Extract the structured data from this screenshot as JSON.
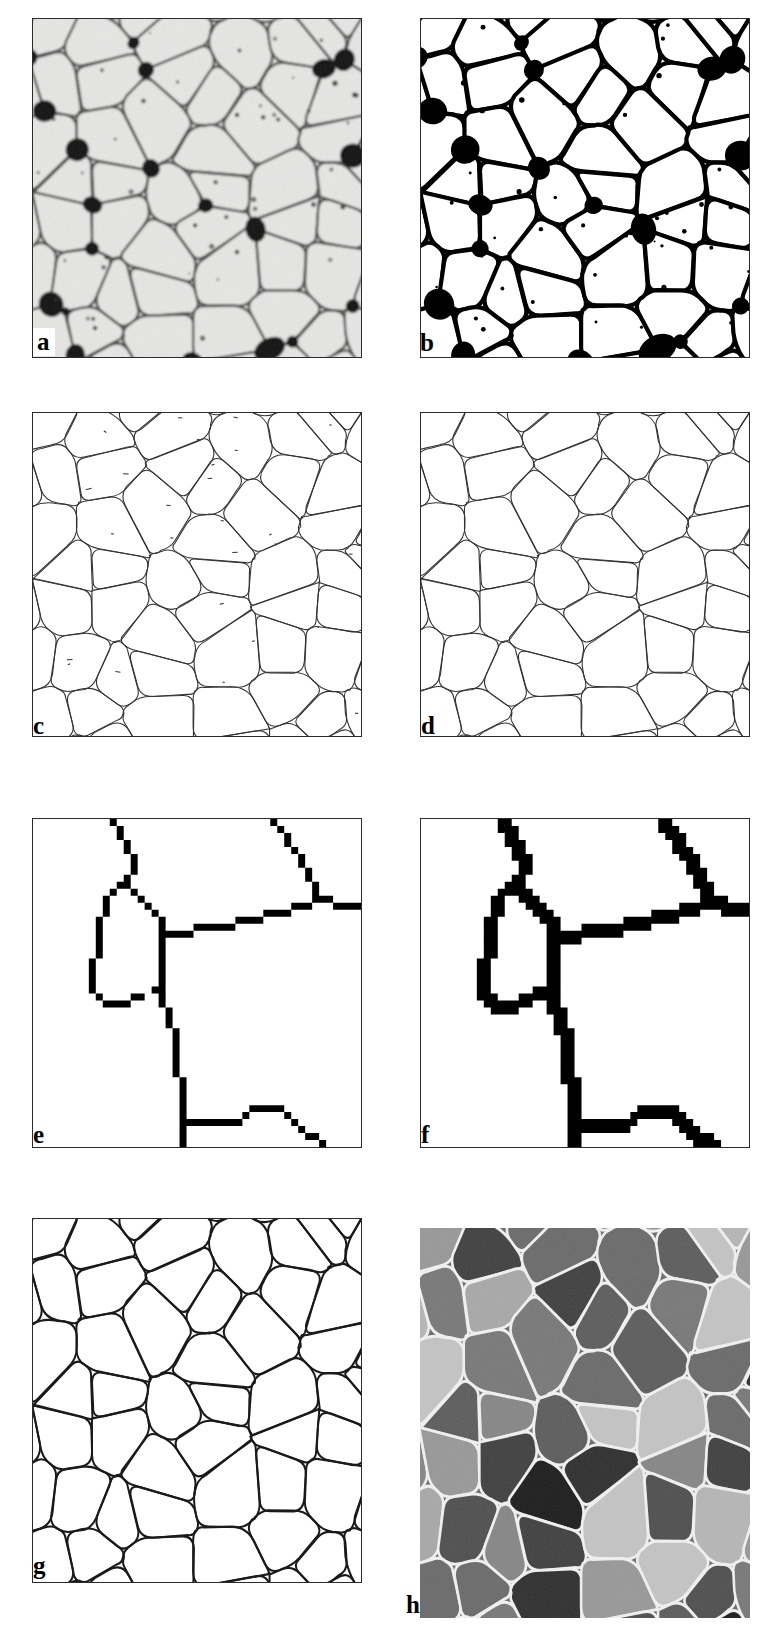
{
  "figure": {
    "type": "multi-panel-micrograph-figure",
    "domain": "materials-science-image-processing",
    "columns": 2,
    "rows": 4,
    "background_color": "#ffffff",
    "panel_border_color": "#2b2b2b"
  },
  "panels": [
    {
      "id": "a",
      "label": "a",
      "label_style": "boxed-white",
      "kind": "grayscale-micrograph",
      "description": "original optical micrograph of polycrystalline grain structure",
      "x": 32,
      "y": 18,
      "w": 330,
      "h": 340,
      "colors": {
        "grain": "#e8e8e6",
        "boundary": "#3a3a3a",
        "pore": "#0d0d0d",
        "speck": "#2a2a2a"
      },
      "has_noise": true,
      "has_specks": true
    },
    {
      "id": "b",
      "label": "b",
      "label_style": "plain",
      "kind": "binary-threshold",
      "description": "binarized image after thresholding, grains white and boundaries black",
      "x": 420,
      "y": 18,
      "w": 330,
      "h": 340,
      "colors": {
        "grain": "#ffffff",
        "boundary": "#000000"
      },
      "has_noise": false,
      "has_specks": true
    },
    {
      "id": "c",
      "label": "c",
      "label_style": "plain",
      "kind": "thin-skeleton-raw",
      "description": "skeletonized boundary network with residual artifacts and isolated specks",
      "x": 32,
      "y": 412,
      "w": 330,
      "h": 325,
      "colors": {
        "grain": "#ffffff",
        "boundary": "#333333"
      },
      "line_width": 1.1,
      "has_specks": true
    },
    {
      "id": "d",
      "label": "d",
      "label_style": "plain",
      "kind": "thin-skeleton-cleaned",
      "description": "skeleton after removal of isolated artifacts and spurious branches",
      "x": 420,
      "y": 412,
      "w": 330,
      "h": 325,
      "colors": {
        "grain": "#ffffff",
        "boundary": "#333333"
      },
      "line_width": 1.1,
      "has_specks": false
    },
    {
      "id": "e",
      "label": "e",
      "label_style": "plain",
      "kind": "magnified-pixel-skeleton-broken",
      "description": "magnified detail of skeleton showing a gap (discontinuity) in a boundary",
      "x": 32,
      "y": 818,
      "w": 330,
      "h": 330,
      "colors": {
        "grain": "#ffffff",
        "boundary": "#000000"
      },
      "pixel_size": 7,
      "line_thickness_px": 1,
      "has_gap": true
    },
    {
      "id": "f",
      "label": "f",
      "label_style": "plain",
      "kind": "magnified-pixel-skeleton-repaired",
      "description": "same detail after gap closing and dilation, boundary now continuous and thicker",
      "x": 420,
      "y": 818,
      "w": 330,
      "h": 330,
      "colors": {
        "grain": "#ffffff",
        "boundary": "#000000"
      },
      "pixel_size": 7,
      "line_thickness_px": 2,
      "has_gap": false
    },
    {
      "id": "g",
      "label": "g",
      "label_style": "plain",
      "kind": "closed-boundary-network",
      "description": "final reconstructed closed grain-boundary network",
      "x": 32,
      "y": 1218,
      "w": 330,
      "h": 365,
      "colors": {
        "grain": "#ffffff",
        "boundary": "#1a1a1a"
      },
      "line_width": 2.0,
      "has_specks": false
    },
    {
      "id": "h",
      "label": "h",
      "label_style": "plain",
      "kind": "labeled-grains-grayscale",
      "description": "individually labeled grains rendered with distinct gray levels, boundaries in white",
      "x": 420,
      "y": 1228,
      "w": 330,
      "h": 390,
      "colors": {
        "boundary": "#f2f2f2"
      },
      "gray_levels": [
        "#1b1b1b",
        "#2e2e2e",
        "#3f3f3f",
        "#4e4e4e",
        "#5c5c5c",
        "#6a6a6a",
        "#787878",
        "#868686",
        "#989898",
        "#a8a8a8",
        "#b6b6b6",
        "#c4c4c4"
      ],
      "has_noise": true
    }
  ],
  "labels": {
    "a": "a",
    "b": "b",
    "c": "c",
    "d": "d",
    "e": "e",
    "f": "f",
    "g": "g",
    "h": "h"
  }
}
